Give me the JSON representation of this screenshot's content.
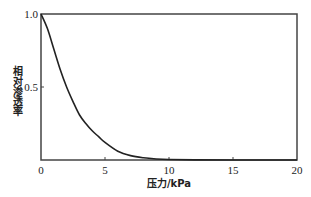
{
  "chart_data": {
    "type": "line",
    "title": "",
    "xlabel": "压力/kPa",
    "ylabel": "相对渗透率",
    "xlim": [
      0,
      20
    ],
    "ylim": [
      0,
      1.0
    ],
    "xticks": [
      0,
      5,
      10,
      15,
      20
    ],
    "xtick_labels": [
      "0",
      "5",
      "10",
      "15",
      "20"
    ],
    "yticks": [
      0.5,
      1.0
    ],
    "ytick_labels": [
      "0.5",
      "1.0"
    ],
    "grid": false,
    "legend": null,
    "series": [
      {
        "name": "relative permeability",
        "color": "#222222",
        "x": [
          0,
          0.5,
          1.0,
          1.5,
          2.0,
          2.5,
          3.0,
          3.5,
          4.0,
          4.5,
          5.0,
          6.0,
          7.0,
          8.0,
          9.0,
          10.0,
          12.0,
          15.0,
          20.0
        ],
        "y": [
          1.0,
          0.9,
          0.76,
          0.62,
          0.5,
          0.4,
          0.31,
          0.25,
          0.2,
          0.16,
          0.12,
          0.06,
          0.03,
          0.015,
          0.007,
          0.003,
          0.001,
          0.0,
          0.0
        ]
      }
    ]
  }
}
